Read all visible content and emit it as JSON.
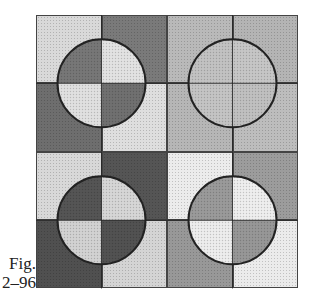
{
  "caption": {
    "line1": "Fig.",
    "line2": "2–96"
  },
  "top_text_cut": "",
  "figure": {
    "quadrants": [
      {
        "position": "top-left",
        "outer": {
          "tl": "#d9d9d9",
          "tr": "#7a7a7a",
          "bl": "#6e6e6e",
          "br": "#dedede"
        },
        "circle": {
          "tl": "#777777",
          "tr": "#e2e2e2",
          "bl": "#e0e0e0",
          "br": "#707070"
        }
      },
      {
        "position": "top-right",
        "outer": {
          "tl": "#b9b9b9",
          "tr": "#b4b4b4",
          "bl": "#b6b6b6",
          "br": "#bdbdbd"
        },
        "circle": {
          "tl": "#c2c2c2",
          "tr": "#c6c6c6",
          "bl": "#c4c4c4",
          "br": "#c0c0c0"
        }
      },
      {
        "position": "bottom-left",
        "outer": {
          "tl": "#d8d8d8",
          "tr": "#555555",
          "bl": "#505050",
          "br": "#d4d4d4"
        },
        "circle": {
          "tl": "#555555",
          "tr": "#d6d6d6",
          "bl": "#d2d2d2",
          "br": "#525252"
        }
      },
      {
        "position": "bottom-right",
        "outer": {
          "tl": "#ececec",
          "tr": "#9c9c9c",
          "bl": "#989898",
          "br": "#ebebeb"
        },
        "circle": {
          "tl": "#9a9a9a",
          "tr": "#eeeeee",
          "bl": "#ededed",
          "br": "#979797"
        }
      }
    ],
    "circle_radius": 44,
    "line_color": "#222222"
  }
}
